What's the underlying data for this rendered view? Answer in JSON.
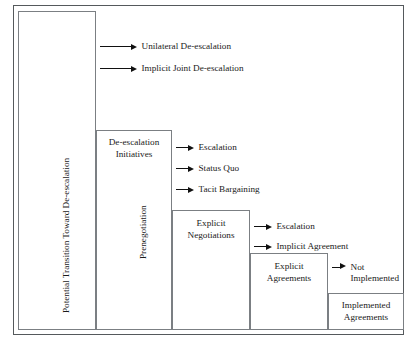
{
  "figure": {
    "background_color": "#ffffff",
    "frame_color": "#55595c",
    "box_border_color": "#7b7f83",
    "text_color": "#1a1a1a",
    "arrow_color": "#111111"
  },
  "vertical_labels": [
    {
      "text": "Potential Transition Toward De-escalation"
    },
    {
      "text": "Prenegotiation"
    }
  ],
  "boxes": [
    {
      "label": ""
    },
    {
      "label": "De-escalation\nInitiatives"
    },
    {
      "label": "Explicit\nNegotiations"
    },
    {
      "label": "Explicit\nAgreements"
    },
    {
      "label": "Implemented\nAgreements"
    }
  ],
  "arrow_groups": [
    {
      "group": "from-potential-transition",
      "arrows": [
        {
          "label": "Unilateral De-escalation"
        },
        {
          "label": "Implicit Joint De-escalation"
        }
      ]
    },
    {
      "group": "from-de-escalation-initiatives",
      "arrows": [
        {
          "label": "Escalation"
        },
        {
          "label": "Status Quo"
        },
        {
          "label": "Tacit Bargaining"
        }
      ]
    },
    {
      "group": "from-explicit-negotiations",
      "arrows": [
        {
          "label": "Escalation"
        },
        {
          "label": "Implicit Agreement"
        }
      ]
    },
    {
      "group": "from-explicit-agreements",
      "arrows": [
        {
          "label": "Not\nImplemented"
        }
      ]
    }
  ]
}
